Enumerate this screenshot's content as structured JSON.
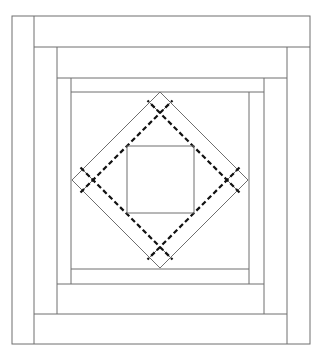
{
  "diagram": {
    "title": "",
    "type": "quilt-block",
    "colors": {
      "background": "#ffffff",
      "line": "#6e6e6e",
      "dashed": "#111111"
    },
    "rings": [
      {
        "name": "outer-ring",
        "outer": {
          "x1": 12,
          "y1": 16,
          "x2": 310,
          "y2": 344
        },
        "strip": 22
      },
      {
        "name": "middle-ring",
        "outer": {
          "x1": 34,
          "y1": 47,
          "x2": 287,
          "y2": 314
        },
        "strip_x": 23,
        "strip_y": 31
      },
      {
        "name": "inner-ring",
        "outer": {
          "x1": 57,
          "y1": 78,
          "x2": 264,
          "y2": 284
        },
        "strip_x": 14,
        "strip_y": 14
      }
    ],
    "center_field": {
      "x1": 71,
      "y1": 92,
      "x2": 249,
      "y2": 269
    },
    "diamond": {
      "center": {
        "x": 160,
        "y": 180
      },
      "outer_half_diagonal": 88,
      "inner_half_diagonal": 67,
      "dashed_half_diagonal": 67
    },
    "center_square": {
      "x1": 127,
      "y1": 146,
      "x2": 194,
      "y2": 213
    }
  }
}
